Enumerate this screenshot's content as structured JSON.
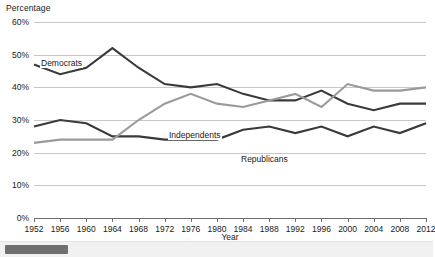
{
  "chart_data": {
    "type": "line",
    "title": "",
    "xlabel": "Year",
    "ylabel": "Percentage",
    "xlim": [
      1952,
      2012
    ],
    "ylim": [
      0,
      60
    ],
    "grid": true,
    "legend_position": "inline-labels",
    "y_ticks": [
      "0%",
      "10%",
      "20%",
      "30%",
      "40%",
      "50%",
      "60%"
    ],
    "y_tick_values": [
      0,
      10,
      20,
      30,
      40,
      50,
      60
    ],
    "categories": [
      1952,
      1956,
      1960,
      1964,
      1968,
      1972,
      1976,
      1980,
      1984,
      1988,
      1992,
      1996,
      2000,
      2004,
      2008,
      2012
    ],
    "x_tick_labels": [
      "1952",
      "1956",
      "1960",
      "1964",
      "1968",
      "1972",
      "1976",
      "1980",
      "1984",
      "1988",
      "1992",
      "1996",
      "2000",
      "2004",
      "2008",
      "2012"
    ],
    "series": [
      {
        "name": "Democrats",
        "color": "#3a3a3a",
        "values": [
          47,
          44,
          46,
          52,
          46,
          41,
          40,
          41,
          38,
          36,
          36,
          39,
          35,
          33,
          35,
          35
        ]
      },
      {
        "name": "Republicans",
        "color": "#3a3a3a",
        "values": [
          28,
          30,
          29,
          25,
          25,
          24,
          24,
          24,
          27,
          28,
          26,
          28,
          25,
          28,
          26,
          29
        ]
      },
      {
        "name": "Independents",
        "color": "#9a9a9a",
        "values": [
          23,
          24,
          24,
          24,
          30,
          35,
          38,
          35,
          34,
          36,
          38,
          34,
          41,
          39,
          39,
          40
        ]
      }
    ],
    "series_labels": [
      {
        "name": "Democrats",
        "text": "Democrats"
      },
      {
        "name": "Independents",
        "text": "Independents"
      },
      {
        "name": "Republicans",
        "text": "Republicans"
      }
    ]
  },
  "scrollbar": {
    "orientation": "horizontal",
    "thumb_position": "left"
  }
}
